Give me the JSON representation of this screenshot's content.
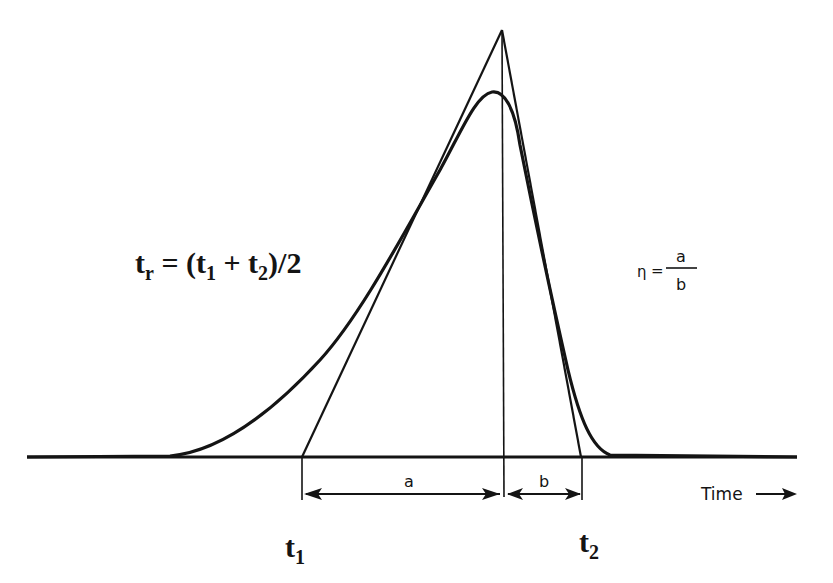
{
  "diagram": {
    "type": "chromatographic peak with tangent triangle",
    "formula_retention": {
      "lhs": "t",
      "lhs_sub": "r",
      "eq": " = (t",
      "sub1": "1",
      "plus": " + t",
      "sub2": "2",
      "tail": ")/2"
    },
    "formula_asymmetry": {
      "symbol": "η",
      "eq": "=",
      "numerator": "a",
      "denominator": "b"
    },
    "segment_a_label": "a",
    "segment_b_label": "b",
    "t1": {
      "main": "t",
      "sub": "1"
    },
    "t2": {
      "main": "t",
      "sub": "2"
    },
    "axis_label": "Time",
    "axis_arrow": "⟶",
    "colors": {
      "ink": "#141414",
      "background": "#ffffff"
    }
  }
}
